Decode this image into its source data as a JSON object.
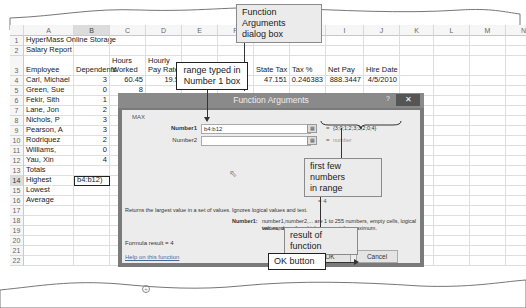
{
  "spreadsheet": {
    "columns": [
      "A",
      "B",
      "C",
      "D",
      "E",
      "F",
      "G",
      "H",
      "I",
      "J",
      "K",
      "L",
      "M",
      "N"
    ],
    "selected_column": "B",
    "rows": [
      {
        "num": "1",
        "A": "HyperMass Online Storage"
      },
      {
        "num": "2",
        "A": "Salary Report"
      },
      {
        "num": "3",
        "A": "Employee",
        "B": "Dependents",
        "C_top": "Hours",
        "C": "Worked",
        "D_top": "Hourly",
        "D": "Pay Rate",
        "E": "Gross Pay",
        "G": "State Tax",
        "H": "Tax %",
        "I": "Net Pay",
        "J": "Hire Date"
      },
      {
        "num": "4",
        "A": "Carl, Michael",
        "B": "3",
        "C": "60.45",
        "D": "19.5",
        "G": "47.151",
        "H": "0.246383",
        "I": "888.3447",
        "J": "4/5/2010"
      },
      {
        "num": "5",
        "A": "Green, Sue",
        "B": "0",
        "C": "8"
      },
      {
        "num": "6",
        "A": "Fekir, Sith",
        "B": "1",
        "C": "6"
      },
      {
        "num": "7",
        "A": "Lane, Jon",
        "B": "2",
        "C": "65"
      },
      {
        "num": "8",
        "A": "Nichols, P",
        "B": "3",
        "C": "71"
      },
      {
        "num": "9",
        "A": "Pearson, A",
        "B": "3",
        "C": "44"
      },
      {
        "num": "10",
        "A": "Rodriquez",
        "B": "2",
        "C": "5"
      },
      {
        "num": "11",
        "A": "Williams,",
        "B": "0"
      },
      {
        "num": "12",
        "A": "Yau, Xin",
        "B": "4"
      },
      {
        "num": "13",
        "A": "Totals",
        "C": "55"
      },
      {
        "num": "14",
        "A": "Highest",
        "B": "b4:b12)"
      },
      {
        "num": "15",
        "A": "Lowest"
      },
      {
        "num": "16",
        "A": "Average"
      },
      {
        "num": "17"
      },
      {
        "num": "18"
      },
      {
        "num": "19"
      },
      {
        "num": "20"
      },
      {
        "num": "21"
      },
      {
        "num": "22"
      }
    ],
    "active_row": "14"
  },
  "dialog": {
    "title": "Function Arguments",
    "help_icon": "?",
    "close_icon": "✕",
    "function_name": "MAX",
    "number1_label": "Number1",
    "number1_value": "b4:b12",
    "number1_result": "{3;0;1;2;3;3;2;0;4}",
    "number2_label": "Number2",
    "number2_result": "number",
    "equals": "=",
    "formula_preview": "= 4",
    "description": "Returns the largest value in a set of values. Ignores logical values and text.",
    "arg_detail_label": "Number1:",
    "arg_detail_text_1": "number1,number2,... are 1 to 255 numbers, empty cells, logical values, or",
    "arg_detail_text_2": "text numbers for which you want the maximum.",
    "formula_result": "Formula result =  4",
    "help_link": "Help on this function",
    "ok_label": "OK",
    "cancel_label": "Cancel"
  },
  "callouts": {
    "dialog_box": "Function Arguments dialog box",
    "dialog_box_line1": "Function Arguments",
    "dialog_box_line2": "dialog box",
    "range_typed_line1": "range typed in",
    "range_typed_line2": "Number 1 box",
    "first_few_line1": "first few numbers",
    "first_few_line2": "in range",
    "result_of_function": "result of function",
    "ok_button": "OK button"
  },
  "sheet_tab": {
    "add_sheet_icon": "+"
  }
}
